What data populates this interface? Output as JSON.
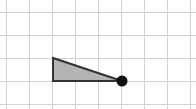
{
  "canvas": {
    "width": 196,
    "height": 109,
    "background_color": "#ffffff",
    "description": "Light gray square grid with a shaded right triangle and a black point marker"
  },
  "grid": {
    "line_color": "#d2d2d2",
    "line_width": 1,
    "cell_size": 23,
    "origin_x": 6,
    "origin_y": 12,
    "vertical_line_x": [
      6,
      29,
      52,
      75,
      98,
      121,
      144,
      167,
      190
    ],
    "horizontal_line_y": [
      12,
      35,
      58,
      81,
      104
    ],
    "columns": 8,
    "rows": 4
  },
  "shape": {
    "name": "right-triangle",
    "type": "polygon",
    "fill_color": "#b4b4b4",
    "stroke_color": "#333333",
    "stroke_width": 2,
    "points_px": "53,58 53,81 122,81",
    "vertices_px": [
      {
        "label": "apex-top-left",
        "x": 53,
        "y": 58
      },
      {
        "label": "corner-bottom-left",
        "x": 53,
        "y": 81
      },
      {
        "label": "point-bottom-right",
        "x": 122,
        "y": 81
      }
    ],
    "vertices_grid": [
      {
        "label": "apex-top-left",
        "col": 2,
        "row": 2
      },
      {
        "label": "corner-bottom-left",
        "col": 2,
        "row": 3
      },
      {
        "label": "point-bottom-right",
        "col": 5,
        "row": 3
      }
    ],
    "base_cells": 3,
    "height_cells": 1
  },
  "marker": {
    "name": "vertex-dot",
    "color": "#111111",
    "radius": 5.5,
    "x": 122,
    "y": 81
  }
}
